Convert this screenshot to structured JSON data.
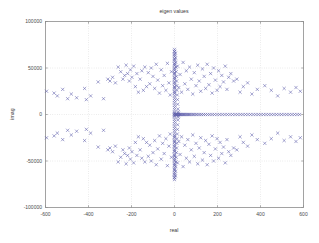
{
  "figure": {
    "background_color": "#ffffff",
    "axes_color": "#8c8c8c",
    "grid_color": "#c8c8c8",
    "marker_color": "#5a5aa8",
    "text_color": "#3a3a3a"
  },
  "chart_data": {
    "type": "scatter",
    "title": "eigen values",
    "xlabel": "real",
    "ylabel": "imag",
    "xlim": [
      -600,
      600
    ],
    "ylim": [
      -100000,
      100000
    ],
    "xticks": [
      -600,
      -400,
      -200,
      0,
      200,
      400,
      600
    ],
    "xticklabels": [
      "-600",
      "-400",
      "-200",
      "0",
      "200",
      "400",
      "600"
    ],
    "yticks": [
      -100000,
      -50000,
      0,
      50000,
      100000
    ],
    "yticklabels": [
      "-100000",
      "-50000",
      "0",
      "50000",
      "100000"
    ],
    "grid": true,
    "grid_style": "dotted",
    "legend": null,
    "marker": "x",
    "marker_color": "#5a5aa8",
    "marker_size": 3.2,
    "series": [
      {
        "name": "eigenvalues",
        "x": [
          0,
          0,
          0,
          0,
          0,
          0,
          0,
          0,
          0,
          0,
          0,
          0,
          0,
          0,
          0,
          0,
          0,
          0,
          0,
          0,
          0,
          0,
          0,
          0,
          0,
          0,
          0,
          0,
          0,
          0,
          0,
          0,
          0,
          0,
          0,
          0,
          0,
          0,
          0,
          0,
          0,
          0,
          0,
          0,
          0,
          0,
          0,
          0,
          0,
          0,
          0,
          0,
          0,
          0,
          0,
          0,
          0,
          0,
          0,
          0,
          0,
          0,
          0,
          0,
          0,
          0,
          0,
          0,
          0,
          0,
          0,
          0,
          0,
          0,
          0,
          0,
          0,
          0,
          0,
          0,
          4,
          4,
          5,
          5,
          6,
          6,
          7,
          7,
          8,
          8,
          9,
          9,
          10,
          10,
          11,
          11,
          12,
          12,
          13,
          13,
          14,
          14,
          15,
          15,
          16,
          16,
          17,
          17,
          18,
          18,
          3,
          6,
          9,
          12,
          15,
          18,
          21,
          24,
          27,
          30,
          34,
          38,
          42,
          46,
          50,
          55,
          60,
          65,
          70,
          76,
          82,
          88,
          95,
          102,
          110,
          118,
          126,
          135,
          144,
          154,
          164,
          175,
          186,
          198,
          210,
          222,
          234,
          246,
          258,
          270,
          282,
          294,
          306,
          318,
          330,
          342,
          354,
          366,
          378,
          390,
          402,
          414,
          426,
          438,
          450,
          462,
          474,
          486,
          498,
          510,
          522,
          534,
          546,
          558,
          570,
          582,
          -595,
          -560,
          -545,
          -520,
          -497,
          -480,
          -455,
          -418,
          -410,
          -390,
          -355,
          -330,
          -310,
          -300,
          -288,
          -275,
          -262,
          -250,
          -240,
          -232,
          -225,
          -218,
          -210,
          -205,
          -198,
          -190,
          -182,
          -175,
          -168,
          -160,
          -152,
          -145,
          -138,
          -130,
          -122,
          -115,
          -108,
          -100,
          -92,
          -85,
          -78,
          -70,
          -62,
          -55,
          -48,
          -40,
          -33,
          -26,
          -20,
          -14,
          14,
          20,
          26,
          33,
          40,
          48,
          55,
          62,
          70,
          78,
          85,
          92,
          100,
          108,
          115,
          122,
          130,
          138,
          145,
          152,
          160,
          168,
          175,
          182,
          190,
          198,
          205,
          212,
          220,
          228,
          236,
          244,
          252,
          262,
          275,
          290,
          305,
          320,
          340,
          360,
          385,
          420,
          450,
          480,
          510,
          540,
          565,
          585,
          -595,
          -560,
          -545,
          -520,
          -497,
          -480,
          -455,
          -418,
          -410,
          -390,
          -355,
          -330,
          -310,
          -300,
          -288,
          -275,
          -262,
          -250,
          -240,
          -232,
          -225,
          -218,
          -210,
          -205,
          -198,
          -190,
          -182,
          -175,
          -168,
          -160,
          -152,
          -145,
          -138,
          -130,
          -122,
          -115,
          -108,
          -100,
          -92,
          -85,
          -78,
          -70,
          -62,
          -55,
          -48,
          -40,
          -33,
          -26,
          -20,
          -14,
          14,
          20,
          26,
          33,
          40,
          48,
          55,
          62,
          70,
          78,
          85,
          92,
          100,
          108,
          115,
          122,
          130,
          138,
          145,
          152,
          160,
          168,
          175,
          182,
          190,
          198,
          205,
          212,
          220,
          228,
          236,
          244,
          252,
          262,
          275,
          290,
          305,
          320,
          340,
          360,
          385,
          420,
          450,
          480,
          510,
          540,
          565,
          585
        ],
        "y": [
          70000,
          67500,
          65000,
          62500,
          60000,
          57500,
          55000,
          52500,
          50000,
          47500,
          45000,
          42500,
          40000,
          37500,
          35000,
          32500,
          30000,
          27500,
          25000,
          22500,
          20000,
          17500,
          15000,
          12500,
          10000,
          7500,
          5000,
          2500,
          1200,
          600,
          -70000,
          -67500,
          -65000,
          -62500,
          -60000,
          -57500,
          -55000,
          -52500,
          -50000,
          -47500,
          -45000,
          -42500,
          -40000,
          -37500,
          -35000,
          -32500,
          -30000,
          -27500,
          -25000,
          -22500,
          -20000,
          -17500,
          -15000,
          -12500,
          -10000,
          -7500,
          -5000,
          -2500,
          -1200,
          -600,
          68000,
          -68000,
          64000,
          -64000,
          59000,
          -59000,
          54000,
          -54000,
          49000,
          -49000,
          44000,
          -44000,
          39000,
          -39000,
          34000,
          -34000,
          29000,
          -29000,
          24000,
          -24000,
          66000,
          -66000,
          61000,
          -61000,
          56000,
          -56000,
          51000,
          -51000,
          46000,
          -46000,
          41000,
          -41000,
          36000,
          -36000,
          31000,
          -31000,
          26000,
          -26000,
          21000,
          -21000,
          16000,
          -16000,
          11000,
          -11000,
          6000,
          -6000,
          3000,
          -3000,
          1500,
          -1500,
          0,
          0,
          0,
          0,
          0,
          0,
          0,
          0,
          0,
          0,
          0,
          0,
          0,
          0,
          0,
          0,
          0,
          0,
          0,
          0,
          0,
          0,
          0,
          0,
          0,
          0,
          0,
          0,
          0,
          0,
          0,
          0,
          0,
          0,
          0,
          0,
          0,
          0,
          0,
          0,
          0,
          0,
          0,
          0,
          0,
          0,
          0,
          0,
          0,
          0,
          0,
          0,
          0,
          0,
          0,
          0,
          0,
          0,
          0,
          0,
          0,
          0,
          0,
          0,
          0,
          0,
          25000,
          23000,
          20000,
          27000,
          17000,
          22000,
          18000,
          28000,
          16000,
          20000,
          35000,
          17000,
          38000,
          36000,
          40000,
          34000,
          51000,
          46000,
          38000,
          42000,
          53000,
          44000,
          36000,
          48000,
          40000,
          52000,
          30000,
          44000,
          24000,
          38000,
          47000,
          26000,
          51000,
          30000,
          45000,
          33000,
          50000,
          41000,
          28000,
          54000,
          37000,
          23000,
          48000,
          31000,
          42000,
          26000,
          55000,
          34000,
          21000,
          46000,
          52000,
          29000,
          43000,
          24000,
          56000,
          33000,
          47000,
          27000,
          51000,
          38000,
          22000,
          45000,
          31000,
          53000,
          36000,
          25000,
          49000,
          41000,
          28000,
          54000,
          32000,
          44000,
          23000,
          50000,
          37000,
          26000,
          47000,
          30000,
          42000,
          35000,
          52000,
          27000,
          40000,
          44000,
          36000,
          38000,
          24000,
          30000,
          34000,
          22000,
          27000,
          31000,
          26000,
          20000,
          28000,
          24000,
          29000,
          25000,
          -25000,
          -23000,
          -20000,
          -27000,
          -17000,
          -22000,
          -18000,
          -28000,
          -16000,
          -20000,
          -35000,
          -17000,
          -38000,
          -36000,
          -40000,
          -34000,
          -51000,
          -46000,
          -38000,
          -42000,
          -53000,
          -44000,
          -36000,
          -48000,
          -40000,
          -52000,
          -30000,
          -44000,
          -24000,
          -38000,
          -47000,
          -26000,
          -51000,
          -30000,
          -45000,
          -33000,
          -50000,
          -41000,
          -28000,
          -54000,
          -37000,
          -23000,
          -48000,
          -31000,
          -42000,
          -26000,
          -55000,
          -34000,
          -21000,
          -46000,
          -52000,
          -29000,
          -43000,
          -24000,
          -56000,
          -33000,
          -47000,
          -27000,
          -51000,
          -38000,
          -22000,
          -45000,
          -31000,
          -53000,
          -36000,
          -25000,
          -49000,
          -41000,
          -28000,
          -54000,
          -32000,
          -44000,
          -23000,
          -50000,
          -37000,
          -26000,
          -47000,
          -30000,
          -42000,
          -35000,
          -52000,
          -27000,
          -40000,
          -44000,
          -36000,
          -38000,
          -24000,
          -30000,
          -34000,
          -22000,
          -27000,
          -31000,
          -26000,
          -20000,
          -28000,
          -24000,
          -29000,
          -25000
        ]
      }
    ]
  }
}
